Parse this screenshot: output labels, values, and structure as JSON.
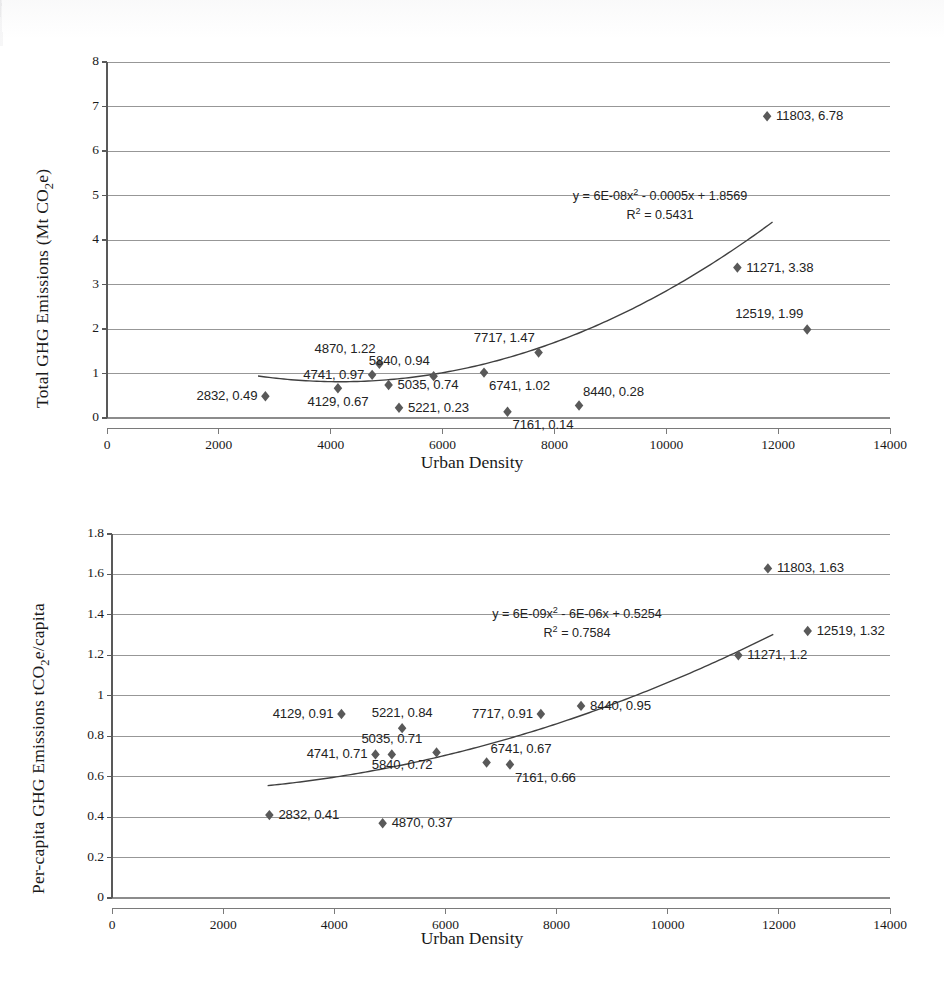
{
  "figure": {
    "background": "#ffffff",
    "marker_color": "#595959",
    "grid_color": "#8c8c8c",
    "trend_color": "#404040"
  },
  "chart_data": [
    {
      "id": "total-ghg-vs-urban-density",
      "type": "scatter",
      "title": "",
      "xlabel": "Urban Density",
      "ylabel": "Total GHG Emissions (Mt CO₂e)",
      "ylabel_parts": {
        "pre": "Total GHG Emissions (Mt CO",
        "sub": "2",
        "post": "e)"
      },
      "xlim": [
        0,
        14000
      ],
      "ylim": [
        0,
        8
      ],
      "xticks": [
        0,
        2000,
        4000,
        6000,
        8000,
        10000,
        12000,
        14000
      ],
      "xticklabels": [
        "0",
        "2000",
        "4000",
        "6000",
        "8000",
        "10000",
        "12000",
        "14000"
      ],
      "yticks": [
        0,
        1,
        2,
        3,
        4,
        5,
        6,
        7,
        8
      ],
      "yticklabels": [
        "0",
        "1",
        "2",
        "3",
        "4",
        "5",
        "6",
        "7",
        "8"
      ],
      "grid": true,
      "legend": "none",
      "trendline": {
        "kind": "polynomial-2",
        "equation": "y = 6E-08x² - 0.0005x + 1.8569",
        "equation_parts": {
          "pre": "y = 6E-08x",
          "sup": "2",
          "post": " - 0.0005x + 1.8569"
        },
        "r2": "R² = 0.5431",
        "r2_parts": {
          "pre": "R",
          "sup": "2",
          "post": " = 0.5431"
        },
        "a": 6e-08,
        "b": -0.0005,
        "c": 1.8569,
        "xstart": 2700,
        "xend": 11900
      },
      "points": [
        {
          "x": 2832,
          "y": 0.49,
          "label": "2832, 0.49",
          "label_pos": "left"
        },
        {
          "x": 4129,
          "y": 0.67,
          "label": "4129, 0.67",
          "label_pos": "below"
        },
        {
          "x": 4741,
          "y": 0.97,
          "label": "4741, 0.97",
          "label_pos": "left"
        },
        {
          "x": 4870,
          "y": 1.22,
          "label": "4870, 1.22",
          "label_pos": "above-left"
        },
        {
          "x": 5035,
          "y": 0.74,
          "label": "5035, 0.74",
          "label_pos": "right"
        },
        {
          "x": 5221,
          "y": 0.23,
          "label": "5221, 0.23",
          "label_pos": "right"
        },
        {
          "x": 5840,
          "y": 0.94,
          "label": "5840, 0.94",
          "label_pos": "above-left"
        },
        {
          "x": 6741,
          "y": 1.02,
          "label": "6741, 1.02",
          "label_pos": "below-right"
        },
        {
          "x": 7161,
          "y": 0.14,
          "label": "7161, 0.14",
          "label_pos": "below-right"
        },
        {
          "x": 7717,
          "y": 1.47,
          "label": "7717, 1.47",
          "label_pos": "above-left"
        },
        {
          "x": 8440,
          "y": 0.28,
          "label": "8440, 0.28",
          "label_pos": "above-right"
        },
        {
          "x": 11271,
          "y": 3.38,
          "label": "11271, 3.38",
          "label_pos": "right"
        },
        {
          "x": 11803,
          "y": 6.78,
          "label": "11803, 6.78",
          "label_pos": "right"
        },
        {
          "x": 12519,
          "y": 1.99,
          "label": "12519, 1.99",
          "label_pos": "above-left"
        }
      ]
    },
    {
      "id": "per-capita-ghg-vs-urban-density",
      "type": "scatter",
      "title": "",
      "xlabel": "Urban Density",
      "ylabel": "Per-capita GHG Emissions tCO₂e/capita",
      "ylabel_parts": {
        "pre": "Per-capita GHG Emissions  tCO",
        "sub": "2",
        "post": "e/capita"
      },
      "xlim": [
        0,
        14000
      ],
      "ylim": [
        0,
        1.8
      ],
      "xticks": [
        0,
        2000,
        4000,
        6000,
        8000,
        10000,
        12000,
        14000
      ],
      "xticklabels": [
        "0",
        "2000",
        "4000",
        "6000",
        "8000",
        "10000",
        "12000",
        "14000"
      ],
      "yticks": [
        0,
        0.2,
        0.4,
        0.6,
        0.8,
        1,
        1.2,
        1.4,
        1.6,
        1.8
      ],
      "yticklabels": [
        "0",
        "0.2",
        "0.4",
        "0.6",
        "0.8",
        "1",
        "1.2",
        "1.4",
        "1.6",
        "1.8"
      ],
      "grid": true,
      "legend": "none",
      "trendline": {
        "kind": "polynomial-2",
        "equation": "y = 6E-09x² - 6E-06x + 0.5254",
        "equation_parts": {
          "pre": "y = 6E-09x",
          "sup": "2",
          "post": " - 6E-06x + 0.5254"
        },
        "r2": "R² = 0.7584",
        "r2_parts": {
          "pre": "R",
          "sup": "2",
          "post": " = 0.7584"
        },
        "a": 6e-09,
        "b": -6e-06,
        "c": 0.5254,
        "xstart": 2800,
        "xend": 11900
      },
      "points": [
        {
          "x": 2832,
          "y": 0.41,
          "label": "2832, 0.41",
          "label_pos": "right"
        },
        {
          "x": 4129,
          "y": 0.91,
          "label": "4129, 0.91",
          "label_pos": "left"
        },
        {
          "x": 4741,
          "y": 0.71,
          "label": "4741, 0.71",
          "label_pos": "left"
        },
        {
          "x": 4870,
          "y": 0.37,
          "label": "4870, 0.37",
          "label_pos": "right"
        },
        {
          "x": 5035,
          "y": 0.71,
          "label": "5035, 0.71",
          "label_pos": "above"
        },
        {
          "x": 5221,
          "y": 0.84,
          "label": "5221, 0.84",
          "label_pos": "above"
        },
        {
          "x": 5840,
          "y": 0.72,
          "label": "5840, 0.72",
          "label_pos": "below-left"
        },
        {
          "x": 6741,
          "y": 0.67,
          "label": "6741, 0.67",
          "label_pos": "above-right"
        },
        {
          "x": 7161,
          "y": 0.66,
          "label": "7161, 0.66",
          "label_pos": "below-right"
        },
        {
          "x": 7717,
          "y": 0.91,
          "label": "7717, 0.91",
          "label_pos": "left"
        },
        {
          "x": 8440,
          "y": 0.95,
          "label": "8440, 0.95",
          "label_pos": "right"
        },
        {
          "x": 11271,
          "y": 1.2,
          "label": "11271, 1.2",
          "label_pos": "right"
        },
        {
          "x": 11803,
          "y": 1.63,
          "label": "11803, 1.63",
          "label_pos": "right"
        },
        {
          "x": 12519,
          "y": 1.32,
          "label": "12519, 1.32",
          "label_pos": "right"
        }
      ]
    }
  ]
}
